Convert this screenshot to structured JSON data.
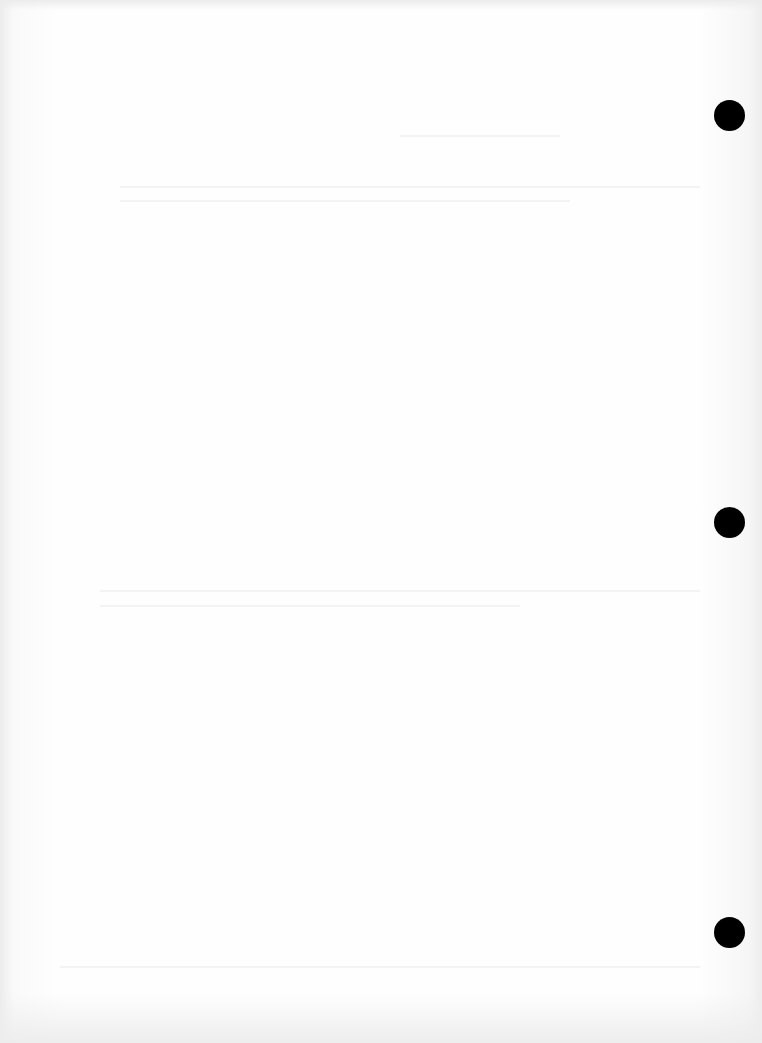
{
  "page": {
    "type": "blank-scanned-page",
    "background": "#fefefe",
    "hole_color": "#000000",
    "hole_punches": [
      {
        "cx": 729,
        "cy": 115,
        "d": 31
      },
      {
        "cx": 729,
        "cy": 522,
        "d": 31
      },
      {
        "cx": 729,
        "cy": 932,
        "d": 31
      }
    ]
  }
}
